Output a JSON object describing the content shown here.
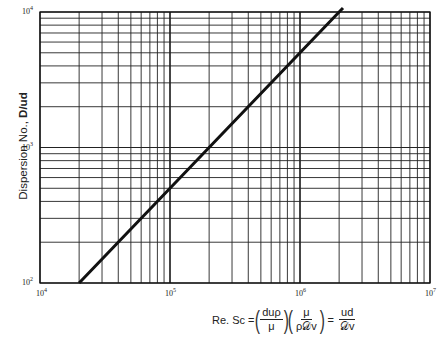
{
  "chart_data": {
    "type": "line",
    "title": "",
    "xlabel": "Re. Sc = (duρ/μ)(μ/ρ𝒟v) = ud/𝒟v",
    "ylabel": "Dispersion No., D/ud",
    "xscale": "log",
    "yscale": "log",
    "xlim": [
      10000,
      10000000
    ],
    "ylim": [
      100,
      10000
    ],
    "x_ticks": [
      "10^4",
      "10^5",
      "10^6",
      "10^7"
    ],
    "y_ticks": [
      "10^2",
      "10^3",
      "10^4"
    ],
    "grid": true,
    "legend": null,
    "series": [
      {
        "name": "D/ud vs Re.Sc",
        "x": [
          20000,
          200000,
          2000000
        ],
        "y": [
          100,
          1000,
          10000
        ]
      }
    ]
  },
  "axis": {
    "y_label_main": "Dispersion No., ",
    "y_label_bold": "D/ud",
    "x_ticks": [
      {
        "base": "10",
        "exp": "4"
      },
      {
        "base": "10",
        "exp": "5"
      },
      {
        "base": "10",
        "exp": "6"
      },
      {
        "base": "10",
        "exp": "7"
      }
    ],
    "y_ticks": [
      {
        "base": "10",
        "exp": "2"
      },
      {
        "base": "10",
        "exp": "3"
      },
      {
        "base": "10",
        "exp": "4"
      }
    ]
  },
  "formula": {
    "lhs": "Re. Sc =",
    "f1_num": "duρ",
    "f1_den": "μ",
    "f2_num": "μ",
    "f2_den": "ρ𝒟v",
    "eq": "=",
    "f3_num": "ud",
    "f3_den": "𝒟v"
  },
  "style": {
    "line_color": "#111111",
    "grid_color": "#222222"
  }
}
